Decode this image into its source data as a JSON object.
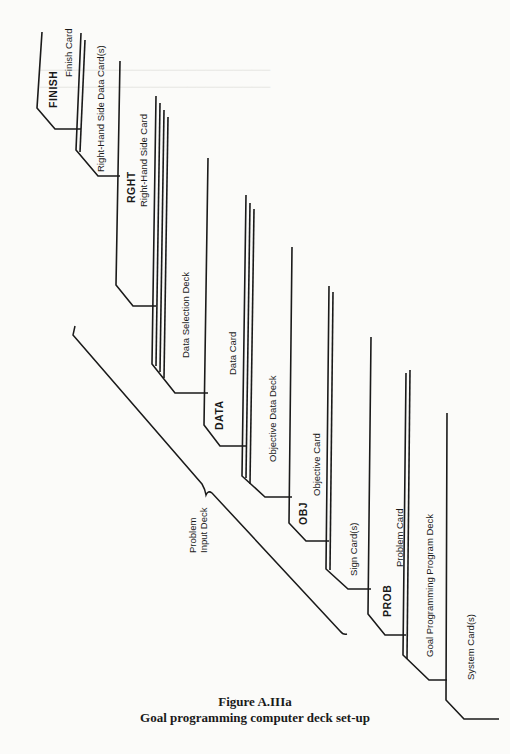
{
  "figure": {
    "number": "Figure A.IIIa",
    "title": "Goal programming computer deck set-up"
  },
  "cards": [
    {
      "code": "FINISH",
      "label": "Finish Card"
    },
    {
      "code": "",
      "label": "Right-Hand Side Data Card(s)"
    },
    {
      "code": "RGHT",
      "label": "Right-Hand Side Card"
    },
    {
      "code": "",
      "label": "Data Selection Deck"
    },
    {
      "code": "DATA",
      "label": "Data Card"
    },
    {
      "code": "",
      "label": "Objective Data Deck"
    },
    {
      "code": "OBJ",
      "label": "Objective Card"
    },
    {
      "code": "",
      "label": "Sign Card(s)"
    },
    {
      "code": "PROB",
      "label": "Problem Card"
    },
    {
      "code": "",
      "label": "Goal Programming Program Deck"
    },
    {
      "code": "",
      "label": "System Card(s)"
    }
  ],
  "bracket": {
    "label_line1": "Problem",
    "label_line2": "Input Deck"
  },
  "colors": {
    "ink": "#1a1a1a",
    "paper": "#fbfbf9"
  }
}
